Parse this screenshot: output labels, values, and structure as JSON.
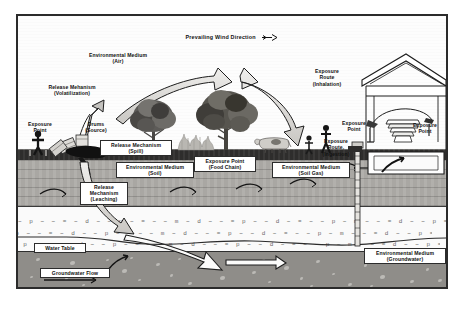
{
  "figure": {
    "title": "Prevailing Wind Direction",
    "title_icon": "wind-arrow-icon",
    "type": "conceptual-site-model-diagram"
  },
  "labels": {
    "env_medium_air": "Environmental Medium\n(Air)",
    "env_medium_air_l1": "Environmental Medium",
    "env_medium_air_l2": "(Air)",
    "release_volatilization_l1": "Release Mehanism",
    "release_volatilization_l2": "(Volatilization)",
    "exposure_point_left_l1": "Exposure",
    "exposure_point_left_l2": "Point",
    "drums_source_l1": "Drums",
    "drums_source_l2": "(Source)",
    "release_spill_l1": "Release Mechanism",
    "release_spill_l2": "(Spill)",
    "env_medium_soil_l1": "Environmental Medium",
    "env_medium_soil_l2": "(Soil)",
    "release_leaching_l1": "Release",
    "release_leaching_l2": "Mechanism",
    "release_leaching_l3": "(Leaching)",
    "exposure_point_food_l1": "Exposure Point",
    "exposure_point_food_l2": "(Food Chain)",
    "env_medium_soilgas_l1": "Environmental Medium",
    "env_medium_soilgas_l2": "(Soil Gas)",
    "exposure_route_inhalation_l1": "Exposure",
    "exposure_route_inhalation_l2": "Route",
    "exposure_route_inhalation_l3": "(Inhalation)",
    "exposure_point_person_l1": "Exposure",
    "exposure_point_person_l2": "Point",
    "exposure_route_ingestion_l1": "Exposure",
    "exposure_route_ingestion_l2": "Route,",
    "exposure_route_ingestion_l3": "(Ingestion)",
    "exposure_point_house_l1": "Exposure",
    "exposure_point_house_l2": "Point",
    "water_table": "Water Table",
    "groundwater_flow": "Groundwater Flow",
    "env_medium_groundwater_l1": "Environmental Medium",
    "env_medium_groundwater_l2": "(Groundwater)"
  },
  "scene": {
    "trees": 2,
    "bushes": 1,
    "cow": "cow-icon",
    "child": "child-figure-icon",
    "adult": "adult-figure-icon",
    "person_left": "person-figure-icon",
    "house": "house-cutaway-icon",
    "well": "monitoring-well-icon",
    "drums": "drum-stack-icon",
    "spill": "spill-plume-icon"
  },
  "colors": {
    "frame": "#2b2b2b",
    "sky": "#fdfdfd",
    "topsoil": "#2e2d2c",
    "soil": "#a9a7a3",
    "vadose": "#fafafa",
    "aquifer": "#8f8d89",
    "arrow_fill": "#d7d5d1",
    "arrow_stroke": "#1d1d1d",
    "label_bg": "#ffffff",
    "label_text": "#111111"
  },
  "hatch": {
    "row": "~ p ~ ~ = ~ d ~ ~ p ~ = ~ ~ m ~ d ~ ~ = p ~ ~ d ~ = ~ ~ p ~ m ~ ~ = d ~ ~ p = ~ ~ d ~ m ~ ~ = p ~ ~ d ~ = ~ p ~ ~ m = ~ ~ d p ~ ~ = ~ d ~ m ~ ~ p = ~ ~ d ~ = p ~ ~ m ~ d = ~ ~ p ~ ~ = d ~ m ~ p ~ = ~ ~ d ~ ~ p = m ~ ~ d ~ = ~ p ~ ~ m d ~ = ~ ~ p"
  }
}
